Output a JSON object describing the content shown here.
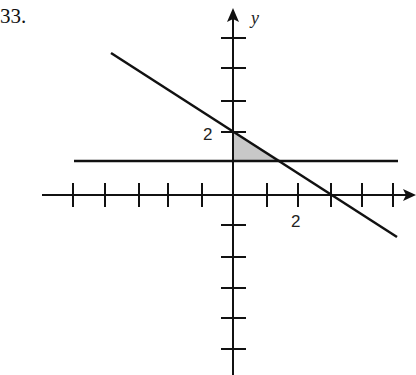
{
  "problem_number": "33.",
  "axes": {
    "x_label": "x",
    "y_label": "y",
    "x_tick_label": "2",
    "y_tick_label": "2"
  },
  "graph": {
    "lines": [
      {
        "name": "horizontal-line",
        "equation": "y = 1"
      },
      {
        "name": "diagonal-line",
        "equation": "y = 2 - (2/3)x",
        "y_intercept": 2,
        "x_intercept": 3
      }
    ],
    "shaded_region": "triangle bounded by y-axis, y = 1, and diagonal line",
    "colors": {
      "line": "#111111",
      "shade": "#c8c8c8"
    }
  }
}
